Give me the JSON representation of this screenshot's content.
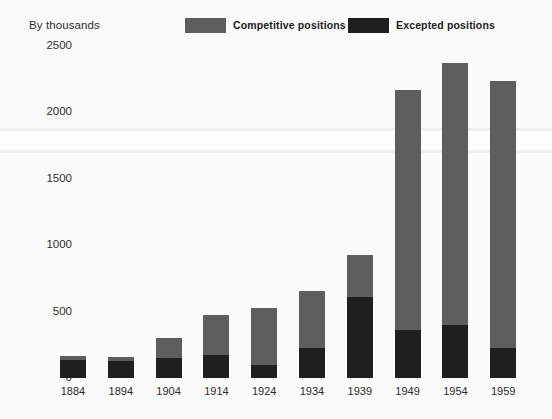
{
  "chart_data": {
    "type": "bar",
    "bar_mode": "stacked",
    "title": "",
    "subtitle": "",
    "units_note": "By thousands",
    "xlabel": "",
    "ylabel": "",
    "categories": [
      "1884",
      "1894",
      "1904",
      "1914",
      "1924",
      "1934",
      "1939",
      "1949",
      "1954",
      "1959"
    ],
    "series": [
      {
        "name": "Excepted positions",
        "color": "#1f1f1f",
        "values": [
          135,
          128,
          150,
          173,
          98,
          226,
          609,
          361,
          399,
          226
        ]
      },
      {
        "name": "Competitive positions",
        "color": "#5e5e5e",
        "values": [
          30,
          30,
          150,
          301,
          428,
          428,
          316,
          1805,
          1969,
          2007
        ]
      }
    ],
    "totals": [
      165,
      158,
      300,
      474,
      526,
      654,
      925,
      2166,
      2368,
      2233
    ],
    "yticks": [
      0,
      500,
      1000,
      1500,
      2000,
      2500
    ],
    "ytick_labels": [
      "0",
      "500",
      "1000",
      "1500",
      "2000",
      "2500"
    ],
    "ylim": [
      0,
      2500
    ],
    "grid": false,
    "legend_position": "top"
  },
  "legend": {
    "entries": [
      {
        "label": "Competitive positions",
        "color": "#5e5e5e",
        "swatch_name": "legend-swatch-competitive"
      },
      {
        "label": "Excepted positions",
        "color": "#1f1f1f",
        "swatch_name": "legend-swatch-excepted"
      }
    ]
  },
  "axis": {
    "units_label": "By thousands"
  },
  "colors": {
    "background": "#fbfbfb",
    "competitive": "#5e5e5e",
    "excepted": "#1f1f1f",
    "text": "#2a2a2a"
  }
}
